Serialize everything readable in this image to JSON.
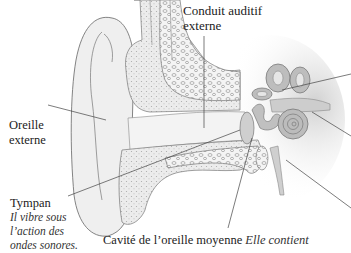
{
  "diagram": {
    "colors": {
      "background": "#ffffff",
      "line": "#555555",
      "skin_fill": "#ececec",
      "bone_fill": "#e2e2e2",
      "inner_ear_fill": "#b9b9b9",
      "text": "#222222"
    },
    "labels": {
      "conduit": {
        "line1": "Conduit auditif",
        "line2": "externe"
      },
      "oreille_externe": {
        "line1": "Oreille",
        "line2": "externe"
      },
      "tympan": {
        "title": "Tympan",
        "desc1": "Il vibre sous",
        "desc2": "l’action des",
        "desc3": "ondes sonores."
      },
      "cavite": {
        "title": "Cavité de l’oreille moyenne",
        "desc": "Elle contient"
      }
    }
  }
}
